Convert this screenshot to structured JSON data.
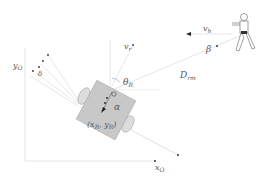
{
  "diagram": {
    "labels": {
      "y_axis": "y",
      "y_axis_sub": "O",
      "x_axis": "x",
      "x_axis_sub": "O",
      "robot_velocity": "v",
      "robot_velocity_sub": "r",
      "human_velocity": "v",
      "human_velocity_sub": "h",
      "theta": "θ",
      "theta_sub": "R",
      "alpha": "α",
      "beta": "β",
      "delta": "δ",
      "distance": "D",
      "distance_sub": "rm",
      "robot_position": "(x",
      "robot_position_xsub": "R",
      "robot_position_mid": ", y",
      "robot_position_ysub": "R",
      "robot_position_end": ")"
    },
    "colors": {
      "line": "#cccccc",
      "robot_body": "#c8c8c8",
      "robot_edge": "#999999",
      "wheel": "#d8d8d8",
      "text": "#555555",
      "arrow": "#222222"
    }
  }
}
